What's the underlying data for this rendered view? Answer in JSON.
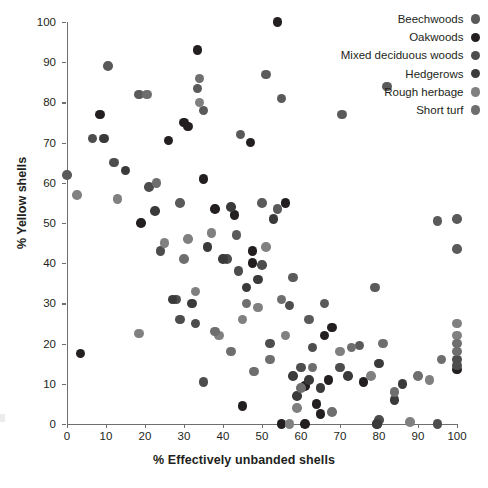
{
  "chart_data": {
    "type": "scatter",
    "title": "",
    "xlabel": "% Effectively unbanded shells",
    "ylabel": "% Yellow shells",
    "xlim": [
      0,
      100
    ],
    "ylim": [
      0,
      100
    ],
    "xticks": [
      0,
      10,
      20,
      30,
      40,
      50,
      60,
      70,
      80,
      90,
      100
    ],
    "yticks": [
      0,
      10,
      20,
      30,
      40,
      50,
      60,
      70,
      80,
      90,
      100
    ],
    "grid": false,
    "legend_position": "top-right",
    "marker": "filled-circle",
    "series": [
      {
        "name": "Beechwoods",
        "color": "#5a5a5a",
        "points": [
          [
            0,
            62
          ],
          [
            10.5,
            89
          ],
          [
            18.5,
            82
          ],
          [
            29,
            55
          ],
          [
            33.5,
            83.5
          ],
          [
            35,
            78
          ],
          [
            44.5,
            72
          ],
          [
            51,
            87
          ],
          [
            55,
            81
          ],
          [
            70.5,
            77
          ],
          [
            43.5,
            47
          ],
          [
            50,
            55
          ],
          [
            54,
            53.5
          ],
          [
            58,
            36.5
          ],
          [
            62,
            26
          ],
          [
            66,
            30
          ],
          [
            75,
            19.5
          ],
          [
            79,
            34
          ],
          [
            82,
            84
          ],
          [
            95,
            50.5
          ],
          [
            100,
            51
          ],
          [
            100,
            43.5
          ]
        ]
      },
      {
        "name": "Oakwoods",
        "color": "#231f20",
        "points": [
          [
            54,
            100
          ],
          [
            33.5,
            93
          ],
          [
            8.5,
            77
          ],
          [
            19,
            50
          ],
          [
            26,
            70.5
          ],
          [
            30,
            75
          ],
          [
            31,
            74
          ],
          [
            35,
            61
          ],
          [
            38,
            53.5
          ],
          [
            43,
            52
          ],
          [
            47,
            70
          ],
          [
            47.5,
            43
          ],
          [
            47.5,
            40
          ],
          [
            3.5,
            17.5
          ],
          [
            56,
            55
          ],
          [
            61,
            9.5
          ],
          [
            61,
            0
          ],
          [
            55,
            0
          ],
          [
            64,
            5
          ],
          [
            65,
            2.5
          ],
          [
            66,
            22
          ],
          [
            100,
            13.5
          ],
          [
            79.5,
            0
          ],
          [
            67,
            11
          ],
          [
            45,
            4.5
          ],
          [
            68,
            24
          ],
          [
            76,
            10.5
          ]
        ]
      },
      {
        "name": "Mixed deciduous woods",
        "color": "#4d4d4d",
        "points": [
          [
            6.5,
            71
          ],
          [
            12,
            65
          ],
          [
            21,
            59
          ],
          [
            24,
            43
          ],
          [
            28,
            31
          ],
          [
            29,
            26
          ],
          [
            33,
            25
          ],
          [
            35,
            10.5
          ],
          [
            41,
            41
          ],
          [
            44,
            38
          ],
          [
            50,
            39.5
          ],
          [
            52,
            20
          ],
          [
            57,
            29.5
          ],
          [
            60,
            14
          ],
          [
            63,
            19
          ],
          [
            70,
            14
          ],
          [
            80,
            1
          ],
          [
            95,
            0
          ],
          [
            100,
            16
          ],
          [
            100,
            14.5
          ]
        ]
      },
      {
        "name": "Hedgerows",
        "color": "#3a3a3a",
        "points": [
          [
            9.5,
            71
          ],
          [
            15,
            63
          ],
          [
            22.5,
            53
          ],
          [
            27,
            31
          ],
          [
            32,
            30
          ],
          [
            36,
            44
          ],
          [
            40,
            41
          ],
          [
            42,
            54
          ],
          [
            46,
            34
          ],
          [
            49,
            36
          ],
          [
            53,
            51
          ],
          [
            58,
            12
          ],
          [
            59,
            7
          ],
          [
            62,
            11
          ],
          [
            65,
            9
          ],
          [
            72,
            12
          ],
          [
            80,
            15
          ],
          [
            84,
            6
          ],
          [
            86,
            10
          ],
          [
            79.5,
            0
          ]
        ]
      },
      {
        "name": "Rough herbage",
        "color": "#808080",
        "points": [
          [
            2.5,
            57
          ],
          [
            13,
            56
          ],
          [
            18.5,
            22.5
          ],
          [
            25,
            45
          ],
          [
            31,
            46
          ],
          [
            33,
            33
          ],
          [
            34,
            80
          ],
          [
            37,
            47.5
          ],
          [
            39,
            22
          ],
          [
            45,
            26
          ],
          [
            49,
            29
          ],
          [
            51,
            44
          ],
          [
            56,
            22
          ],
          [
            57,
            0
          ],
          [
            59,
            4
          ],
          [
            70,
            18
          ],
          [
            78,
            12
          ],
          [
            88,
            0.5
          ],
          [
            93,
            11
          ],
          [
            100,
            22
          ],
          [
            100,
            25
          ]
        ]
      },
      {
        "name": "Short turf",
        "color": "#6e6e6e",
        "points": [
          [
            20.5,
            82
          ],
          [
            23,
            60
          ],
          [
            30,
            41
          ],
          [
            34,
            86
          ],
          [
            38,
            23
          ],
          [
            42,
            18
          ],
          [
            46,
            30
          ],
          [
            48,
            13
          ],
          [
            52,
            16
          ],
          [
            55,
            31
          ],
          [
            60,
            9
          ],
          [
            63,
            14
          ],
          [
            68,
            3
          ],
          [
            73,
            19
          ],
          [
            81,
            20
          ],
          [
            84,
            8
          ],
          [
            90,
            12
          ],
          [
            96,
            16
          ],
          [
            100,
            18
          ],
          [
            100,
            20
          ]
        ]
      }
    ]
  },
  "legend": {
    "items": [
      {
        "label": "Beechwoods",
        "color": "#5a5a5a"
      },
      {
        "label": "Oakwoods",
        "color": "#231f20"
      },
      {
        "label": "Mixed deciduous woods",
        "color": "#4d4d4d"
      },
      {
        "label": "Hedgerows",
        "color": "#3a3a3a"
      },
      {
        "label": "Rough herbage",
        "color": "#808080"
      },
      {
        "label": "Short turf",
        "color": "#6e6e6e"
      }
    ]
  }
}
